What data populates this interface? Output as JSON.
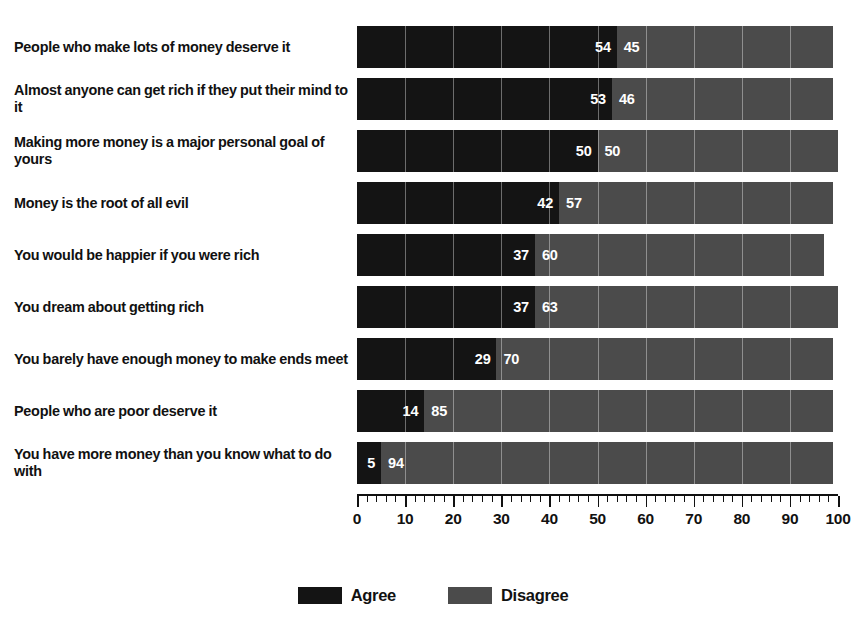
{
  "chart_data": {
    "type": "bar",
    "orientation": "horizontal",
    "stacked": true,
    "title": "",
    "xlabel": "",
    "ylabel": "",
    "xlim": [
      0,
      100
    ],
    "grid": true,
    "legend_position": "bottom-center",
    "categories": [
      "People who make lots of money deserve it",
      "Almost anyone can get rich if they put their mind to it",
      "Making more money is a major personal goal of yours",
      "Money is the root of all evil",
      "You would be happier if you were rich",
      "You dream about getting rich",
      "You barely have enough money to make ends meet",
      "People who are poor deserve it",
      "You have more money than you know what to do with"
    ],
    "series": [
      {
        "name": "Agree",
        "color": "#141414",
        "values": [
          54,
          53,
          50,
          42,
          37,
          37,
          29,
          14,
          5
        ]
      },
      {
        "name": "Disagree",
        "color": "#4b4b4b",
        "values": [
          45,
          46,
          50,
          57,
          60,
          63,
          70,
          85,
          94
        ]
      }
    ],
    "tick_labels": [
      "0",
      "10",
      "20",
      "30",
      "40",
      "50",
      "60",
      "70",
      "80",
      "90",
      "100"
    ],
    "tick_values": [
      0,
      10,
      20,
      30,
      40,
      50,
      60,
      70,
      80,
      90,
      100
    ],
    "minor_ticks_per_major": 5
  },
  "legend": {
    "items": [
      {
        "label": "Agree",
        "color": "#141414"
      },
      {
        "label": "Disagree",
        "color": "#4b4b4b"
      }
    ]
  },
  "colors": {
    "agree": "#141414",
    "disagree": "#4b4b4b",
    "background": "#ffffff",
    "text": "#111111",
    "value_text": "#ffffff"
  }
}
